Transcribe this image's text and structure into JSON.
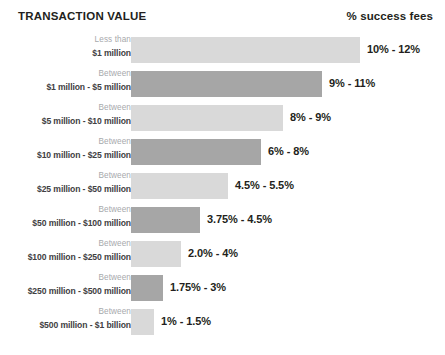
{
  "header": {
    "title_left": "TRANSACTION VALUE",
    "title_right": "% success fees"
  },
  "colors": {
    "bar_light": "#d9d9d9",
    "bar_dark": "#a6a6a6",
    "label_muted": "#a7a9ac",
    "label_strong": "#414042",
    "text": "#231f20",
    "background": "#ffffff"
  },
  "chart_data": {
    "type": "bar",
    "title": "TRANSACTION VALUE",
    "xlabel": "% success fees",
    "ylabel": "",
    "orientation": "horizontal",
    "grid": false,
    "legend": "none",
    "categories": [
      "Less than $1 million",
      "Between $1 million - $5 million",
      "Between $5 million - $10 million",
      "Between $10 million - $25 million",
      "Between $25 million - $50 million",
      "Between $50 million - $100 million",
      "Between $100 million - $250 million",
      "Between $250 million - $500 million",
      "Between $500 million - $1 billion"
    ],
    "value_labels": [
      "10% - 12%",
      "9% - 11%",
      "8% - 9%",
      "6% - 8%",
      "4.5% - 5.5%",
      "3.75% - 4.5%",
      "2.0% - 4%",
      "1.75% - 3%",
      "1% - 1.5%"
    ],
    "ranges_low": [
      10,
      9,
      8,
      6,
      4.5,
      3.75,
      2.0,
      1.75,
      1
    ],
    "ranges_high": [
      12,
      11,
      9,
      8,
      5.5,
      4.5,
      4,
      3,
      1.5
    ],
    "values": [
      12,
      11,
      9,
      8,
      5.5,
      4.5,
      4,
      3,
      1.5
    ],
    "xlim": [
      0,
      12
    ]
  },
  "rows": [
    {
      "label_line1": "Less than",
      "label_line2": "$1 million",
      "value": "10% - 12%",
      "bar_width_px": 229,
      "tone": "tone-light",
      "value_left_px": 367
    },
    {
      "label_line1": "Between",
      "label_line2": "$1 million - $5 million",
      "value": "9% - 11%",
      "bar_width_px": 191,
      "tone": "tone-dark",
      "value_left_px": 329
    },
    {
      "label_line1": "Between",
      "label_line2": "$5 million - $10 million",
      "value": "8% - 9%",
      "bar_width_px": 152,
      "tone": "tone-light",
      "value_left_px": 290
    },
    {
      "label_line1": "Between",
      "label_line2": "$10 million - $25 million",
      "value": "6% - 8%",
      "bar_width_px": 130,
      "tone": "tone-dark",
      "value_left_px": 268
    },
    {
      "label_line1": "Between",
      "label_line2": "$25 million - $50 million",
      "value": "4.5% - 5.5%",
      "bar_width_px": 97,
      "tone": "tone-light",
      "value_left_px": 235
    },
    {
      "label_line1": "Between",
      "label_line2": "$50 million - $100 million",
      "value": "3.75% - 4.5%",
      "bar_width_px": 69,
      "tone": "tone-dark",
      "value_left_px": 207
    },
    {
      "label_line1": "Between",
      "label_line2": "$100 million - $250 million",
      "value": "2.0% - 4%",
      "bar_width_px": 50,
      "tone": "tone-light",
      "value_left_px": 188
    },
    {
      "label_line1": "Between",
      "label_line2": "$250 million - $500 million",
      "value": "1.75% - 3%",
      "bar_width_px": 32,
      "tone": "tone-dark",
      "value_left_px": 170
    },
    {
      "label_line1": "Between",
      "label_line2": "$500 million - $1 billion",
      "value": "1% - 1.5%",
      "bar_width_px": 23,
      "tone": "tone-light",
      "value_left_px": 161
    }
  ]
}
